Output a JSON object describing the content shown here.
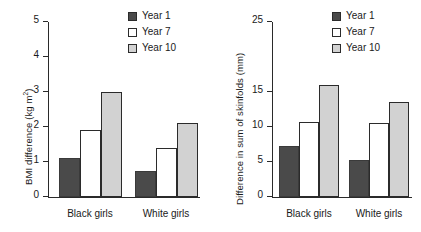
{
  "figure": {
    "background": "#ffffff",
    "colors": {
      "year1": "#4a4a4a",
      "year7": "#ffffff",
      "year10": "#d2d2d2",
      "axis": "#2a2a2a",
      "text": "#1a1a1a"
    }
  },
  "legend": {
    "items": [
      {
        "label": "Year 1",
        "key": "y1"
      },
      {
        "label": "Year 7",
        "key": "y7"
      },
      {
        "label": "Year 10",
        "key": "y10"
      }
    ]
  },
  "panels": {
    "bmi": {
      "ylabel_main": "BMI difference (kg m",
      "ylabel_sup": "2",
      "ylabel_tail": ")",
      "ticks": [
        "0",
        "1",
        "2",
        "3",
        "4",
        "5"
      ],
      "categories": [
        "Black girls",
        "White girls"
      ]
    },
    "skinfolds": {
      "ylabel": "Difference in sum of skinfolds (mm)",
      "ticks": [
        "0",
        "5",
        "10",
        "15",
        "25"
      ],
      "categories": [
        "Black girls",
        "White girls"
      ]
    }
  },
  "chart_data": [
    {
      "id": "bmi",
      "type": "bar",
      "title": "",
      "xlabel": "",
      "ylabel": "BMI difference (kg m2)",
      "categories": [
        "Black girls",
        "White girls"
      ],
      "series": [
        {
          "name": "Year 1",
          "values": [
            1.1,
            0.75
          ],
          "color": "#4a4a4a"
        },
        {
          "name": "Year 7",
          "values": [
            1.9,
            1.4
          ],
          "color": "#ffffff"
        },
        {
          "name": "Year 10",
          "values": [
            3.0,
            2.1
          ],
          "color": "#d2d2d2"
        }
      ],
      "ylim": [
        0,
        5
      ],
      "ytick_values": [
        0,
        1,
        2,
        3,
        4,
        5
      ],
      "ytick_labels": [
        "0",
        "1",
        "2",
        "3",
        "4",
        "5"
      ],
      "grid": false,
      "legend_position": "top-right"
    },
    {
      "id": "skinfolds",
      "type": "bar",
      "title": "",
      "xlabel": "",
      "ylabel": "Difference in sum of skinfolds (mm)",
      "categories": [
        "Black girls",
        "White girls"
      ],
      "series": [
        {
          "name": "Year 1",
          "values": [
            7.3,
            5.3
          ],
          "color": "#4a4a4a"
        },
        {
          "name": "Year 7",
          "values": [
            10.7,
            10.5
          ],
          "color": "#ffffff"
        },
        {
          "name": "Year 10",
          "values": [
            16.0,
            13.6
          ],
          "color": "#d2d2d2"
        }
      ],
      "ylim": [
        0,
        25
      ],
      "ytick_values": [
        0,
        5,
        10,
        15,
        25
      ],
      "ytick_labels": [
        "0",
        "5",
        "10",
        "15",
        "25"
      ],
      "grid": false,
      "legend_position": "top-right"
    }
  ]
}
